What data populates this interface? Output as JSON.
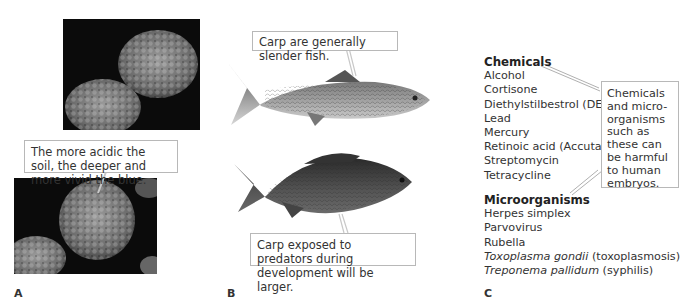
{
  "panels": {
    "a": {
      "label": "A",
      "callout": "The more acidic the soil, the deeper and more vivid the blue."
    },
    "b": {
      "label": "B",
      "callout_top": "Carp are generally slender fish.",
      "callout_bottom": "Carp exposed to predators during development will be larger."
    },
    "c": {
      "label": "C",
      "chemicals_heading": "Chemicals",
      "chemicals": [
        "Alcohol",
        "Cortisone",
        "Diethylstilbestrol (DES)",
        "Lead",
        "Mercury",
        "Retinoic acid (Accutane)",
        "Streptomycin",
        "Tetracycline"
      ],
      "microorganisms_heading": "Microorganisms",
      "microorganisms": [
        {
          "name": "Herpes simplex",
          "italic": "",
          "suffix": ""
        },
        {
          "name": "Parvovirus",
          "italic": "",
          "suffix": ""
        },
        {
          "name": "Rubella",
          "italic": "",
          "suffix": ""
        },
        {
          "name": "",
          "italic": "Toxoplasma gondii",
          "suffix": " (toxoplasmosis)"
        },
        {
          "name": "",
          "italic": "Treponema pallidum",
          "suffix": " (syphilis)"
        }
      ],
      "callout": "Chemicals and micro-organisms such as these can be harmful to human embryos."
    }
  }
}
